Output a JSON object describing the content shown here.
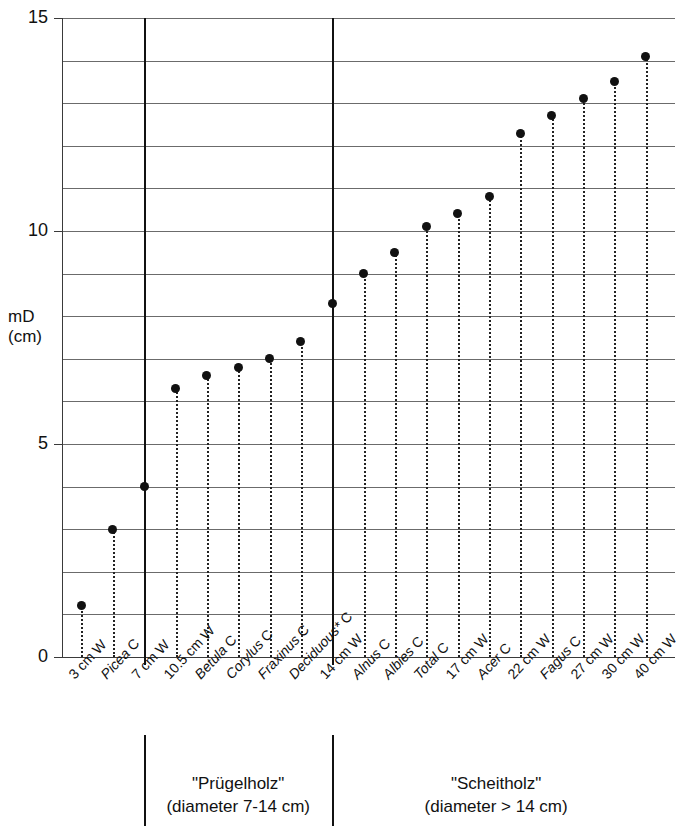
{
  "chart_data": {
    "type": "scatter",
    "title": "",
    "xlabel": "",
    "ylabel": "mD (cm)",
    "ylabel_lines": [
      "mD",
      "(cm)"
    ],
    "ylim": [
      0,
      15
    ],
    "ytick_labels": [
      "0",
      "5",
      "10",
      "15"
    ],
    "ytick_values": [
      0,
      5,
      10,
      15
    ],
    "gridlines": [
      0,
      1,
      2,
      3,
      4,
      5,
      6,
      7,
      8,
      9,
      10,
      11,
      12,
      13,
      14,
      15
    ],
    "grid": true,
    "legend": "none",
    "categories": [
      "3 cm W",
      "Picea C",
      "7 cm W",
      "10.5 cm W",
      "Betula C",
      "Corylus C",
      "Fraxinus C",
      "Deciduous* C",
      "14 cm W",
      "Alnus C",
      "Albies C",
      "Total C",
      "17 cm W",
      "Acer C",
      "22 cm W",
      "Fagus C",
      "27 cm W",
      "30 cm W",
      "40 cm W"
    ],
    "category_parts": [
      {
        "italic": "",
        "plain": "3 cm W"
      },
      {
        "italic": "Picea",
        "plain": " C"
      },
      {
        "italic": "",
        "plain": "7 cm W"
      },
      {
        "italic": "",
        "plain": "10.5 cm W"
      },
      {
        "italic": "Betula",
        "plain": " C"
      },
      {
        "italic": "Corylus",
        "plain": " C"
      },
      {
        "italic": "Fraxinus",
        "plain": " C"
      },
      {
        "italic": "Deciduous*",
        "plain": " C"
      },
      {
        "italic": "",
        "plain": "14 cm W"
      },
      {
        "italic": "Alnus",
        "plain": " C"
      },
      {
        "italic": "Albies",
        "plain": " C"
      },
      {
        "italic": "Total",
        "plain": " C"
      },
      {
        "italic": "",
        "plain": "17 cm W"
      },
      {
        "italic": "Acer",
        "plain": " C"
      },
      {
        "italic": "",
        "plain": "22 cm W"
      },
      {
        "italic": "Fagus",
        "plain": " C"
      },
      {
        "italic": "",
        "plain": "27 cm W"
      },
      {
        "italic": "",
        "plain": "30 cm W"
      },
      {
        "italic": "",
        "plain": "40 cm W"
      }
    ],
    "values": [
      1.2,
      3.0,
      4.0,
      6.3,
      6.6,
      6.8,
      7.0,
      7.4,
      8.3,
      9.0,
      9.5,
      10.1,
      10.4,
      10.8,
      12.3,
      12.7,
      13.1,
      13.5,
      14.1
    ],
    "separators": [
      {
        "after_index": 1,
        "label": "7 cm W"
      },
      {
        "after_index": 7,
        "label": "14 cm W"
      }
    ],
    "groups": [
      {
        "name": "\"Prügelholz\"",
        "detail": "(diameter 7-14 cm)",
        "start_index": 2,
        "end_index": 7
      },
      {
        "name": "\"Scheitholz\"",
        "detail": "(diameter > 14 cm)",
        "start_index": 8,
        "end_index": 18
      }
    ],
    "colors": {
      "point": "#111111",
      "gridline": "#6b6b6b",
      "axis": "#3a3a3a",
      "separator": "#111111",
      "background": "#ffffff"
    }
  }
}
